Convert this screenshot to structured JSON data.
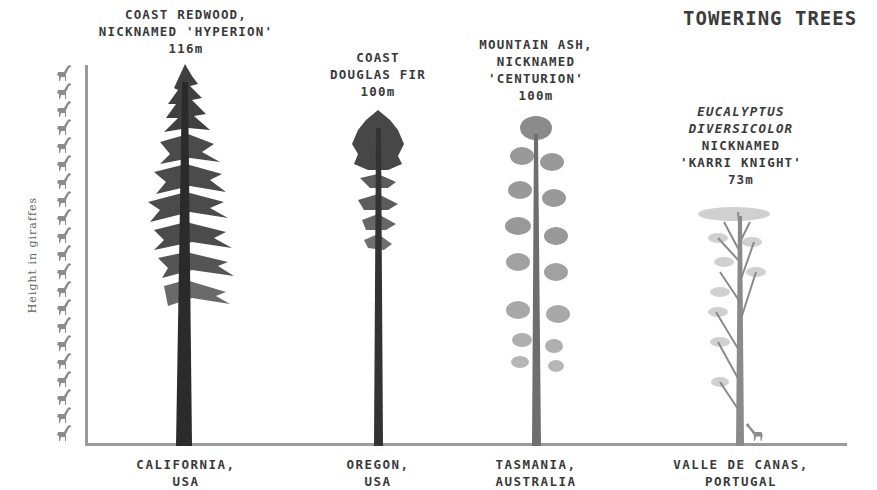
{
  "title": "TOWERING TREES",
  "y_axis_label": "Height in giraffes",
  "giraffe_count": 21,
  "trees": [
    {
      "name_lines": [
        "COAST REDWOOD,",
        "NICKNAMED 'HYPERION'"
      ],
      "height_label": "116m",
      "location_lines": [
        "CALIFORNIA,",
        "USA"
      ]
    },
    {
      "name_lines": [
        "COAST",
        "DOUGLAS FIR"
      ],
      "height_label": "100m",
      "location_lines": [
        "OREGON,",
        "USA"
      ]
    },
    {
      "name_lines": [
        "MOUNTAIN ASH,",
        "NICKNAMED",
        "'CENTURION'"
      ],
      "height_label": "100m",
      "location_lines": [
        "TASMANIA,",
        "AUSTRALIA"
      ]
    },
    {
      "name_lines": [
        "EUCALYPTUS",
        "DIVERSICOLOR",
        "NICKNAMED",
        "'KARRI KNIGHT'"
      ],
      "height_label": "73m",
      "location_lines": [
        "VALLE DE CANAS,",
        "PORTUGAL"
      ]
    }
  ],
  "colors": {
    "axis": "#9a9a9a",
    "text": "#3a3a3a",
    "redwood": "#2a2a2a",
    "douglas_fir": "#333333",
    "mountain_ash": "#6e6e6e",
    "eucalyptus": "#8a8a8a",
    "giraffe": "#8c8c8c"
  },
  "chart_data": {
    "type": "bar",
    "title": "TOWERING TREES",
    "xlabel": "",
    "ylabel": "Height in giraffes",
    "categories": [
      "Coast Redwood 'Hyperion' (California, USA)",
      "Coast Douglas Fir (Oregon, USA)",
      "Mountain Ash 'Centurion' (Tasmania, Australia)",
      "Eucalyptus diversicolor 'Karri Knight' (Valle de Canas, Portugal)"
    ],
    "values": [
      116,
      100,
      100,
      73
    ],
    "units": "m",
    "y_axis_ticks": "21 giraffe icons stacked along the y-axis",
    "grid": false,
    "legend": "none"
  }
}
